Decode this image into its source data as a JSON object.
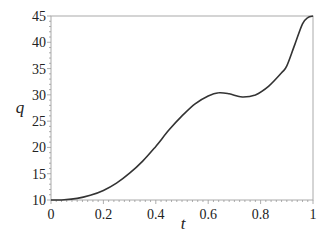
{
  "chart_data": {
    "type": "line",
    "title": "",
    "xlabel": "t",
    "ylabel": "q",
    "xlim": [
      0,
      1
    ],
    "ylim": [
      10,
      45
    ],
    "grid": false,
    "legend": null,
    "x_ticks": [
      "0",
      "0.2",
      "0.4",
      "0.6",
      "0.8",
      "1"
    ],
    "y_ticks": [
      "10",
      "15",
      "20",
      "25",
      "30",
      "35",
      "40",
      "45"
    ],
    "series": [
      {
        "name": "q(t)",
        "color": "#333333",
        "x": [
          0,
          0.05,
          0.1,
          0.15,
          0.2,
          0.25,
          0.3,
          0.35,
          0.4,
          0.45,
          0.5,
          0.55,
          0.6,
          0.64,
          0.68,
          0.73,
          0.78,
          0.83,
          0.88,
          0.9,
          0.93,
          0.96,
          0.98,
          1.0
        ],
        "values": [
          10,
          10.05,
          10.3,
          10.9,
          11.8,
          13.2,
          15.1,
          17.4,
          20.2,
          23.3,
          26.0,
          28.3,
          29.8,
          30.4,
          30.2,
          29.6,
          30.0,
          31.6,
          34.2,
          35.5,
          39.5,
          43.5,
          44.7,
          45
        ]
      }
    ]
  },
  "axes": {
    "xlabel": "t",
    "ylabel": "q"
  }
}
